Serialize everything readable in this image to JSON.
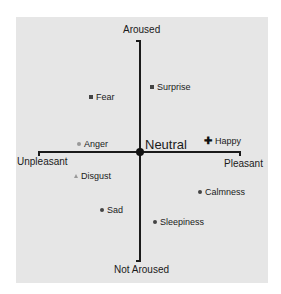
{
  "diagram": {
    "axes": {
      "top": "Aroused",
      "bottom": "Not Aroused",
      "left": "Unpleasant",
      "right": "Pleasant",
      "center": "Neutral"
    },
    "points": [
      {
        "label": "Surprise",
        "marker": "square"
      },
      {
        "label": "Fear",
        "marker": "square"
      },
      {
        "label": "Anger",
        "marker": "circle-light"
      },
      {
        "label": "Happy",
        "marker": "plus"
      },
      {
        "label": "Disgust",
        "marker": "triangle"
      },
      {
        "label": "Calmness",
        "marker": "circle"
      },
      {
        "label": "Sad",
        "marker": "circle"
      },
      {
        "label": "Sleepiness",
        "marker": "circle"
      }
    ]
  }
}
